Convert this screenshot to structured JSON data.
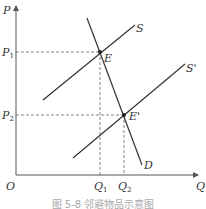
{
  "diagram": {
    "type": "supply-demand",
    "axes": {
      "y_label": "P",
      "x_label": "Q",
      "origin_label": "O"
    },
    "price_levels": [
      {
        "label": "P",
        "sub": "1",
        "y": 52
      },
      {
        "label": "P",
        "sub": "2",
        "y": 115
      }
    ],
    "quantity_levels": [
      {
        "label": "Q",
        "sub": "1",
        "x": 100
      },
      {
        "label": "Q",
        "sub": "2",
        "x": 124
      }
    ],
    "curves": [
      {
        "name": "S",
        "label": "S",
        "from": [
          43,
          100
        ],
        "to": [
          135,
          25
        ]
      },
      {
        "name": "S-prime",
        "label": "S'",
        "from": [
          73,
          158
        ],
        "to": [
          185,
          64
        ]
      },
      {
        "name": "D",
        "label": "D",
        "from": [
          87,
          18
        ],
        "to": [
          142,
          165
        ]
      }
    ],
    "points": [
      {
        "label": "E",
        "x": 100,
        "y": 52
      },
      {
        "label": "E'",
        "x": 124,
        "y": 115
      }
    ],
    "caption": "图 5-8   邻避物品示意图"
  },
  "colors": {
    "line": "#333333",
    "axis": "#555555",
    "dash": "#666666",
    "caption": "#aaaaaa"
  }
}
